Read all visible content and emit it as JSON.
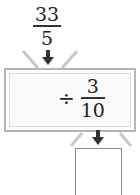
{
  "input": {
    "numerator": "33",
    "denominator": "5"
  },
  "operation": {
    "operator": "÷",
    "numerator": "3",
    "denominator": "10"
  },
  "answer": {
    "value": ""
  },
  "colors": {
    "box_border": "#b5b5b5",
    "arrow": "#333333",
    "funnel": "#c8c8c8"
  }
}
